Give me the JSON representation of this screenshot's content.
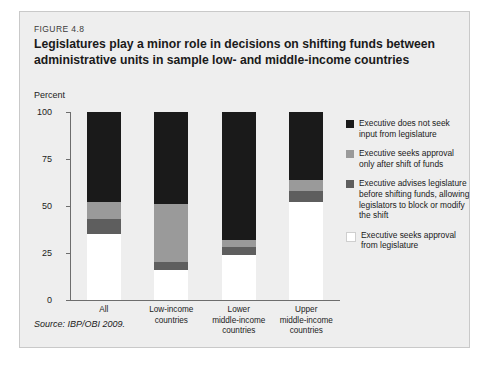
{
  "figure": {
    "number": "FIGURE 4.8",
    "title": "Legislatures play a minor role in decisions on shifting funds between administrative units in sample low- and middle-income countries",
    "axis_label": "Percent",
    "source": "Source: IBP/OBI 2009."
  },
  "chart_data": {
    "type": "bar",
    "stacked": true,
    "title": "Legislatures play a minor role in decisions on shifting funds between administrative units in sample low- and middle-income countries",
    "xlabel": "",
    "ylabel": "Percent",
    "ylim": [
      0,
      100
    ],
    "yticks": [
      0,
      25,
      50,
      75,
      100
    ],
    "grid": false,
    "legend_position": "right",
    "categories": [
      "All",
      "Low-income countries",
      "Lower middle-income countries",
      "Upper middle-income countries"
    ],
    "category_lines": [
      [
        "All"
      ],
      [
        "Low-income",
        "countries"
      ],
      [
        "Lower",
        "middle-income",
        "countries"
      ],
      [
        "Upper",
        "middle-income",
        "countries"
      ]
    ],
    "series": [
      {
        "name": "Executive seeks approval from legislature",
        "color": "#ffffff",
        "values": [
          35,
          16,
          24,
          52
        ]
      },
      {
        "name": "Executive advises legislature before shifting funds, allowing legislators to block or modify the shift",
        "color": "#5e5e5e",
        "values": [
          8,
          4,
          4,
          6
        ]
      },
      {
        "name": "Executive seeks approval only after shift of funds",
        "color": "#9a9a9a",
        "values": [
          9,
          31,
          4,
          6
        ]
      },
      {
        "name": "Executive does not seek input from legislature",
        "color": "#1a1a1a",
        "values": [
          48,
          49,
          68,
          36
        ]
      }
    ],
    "legend_entries": [
      {
        "label": "Executive does not seek input from legislature",
        "color": "#1a1a1a"
      },
      {
        "label": "Executive seeks approval only after shift of funds",
        "color": "#9a9a9a"
      },
      {
        "label": "Executive advises legislature before shifting funds, allowing legislators to block or modify the shift",
        "color": "#5e5e5e"
      },
      {
        "label": "Executive seeks approval from legislature",
        "color": "#ffffff"
      }
    ]
  }
}
